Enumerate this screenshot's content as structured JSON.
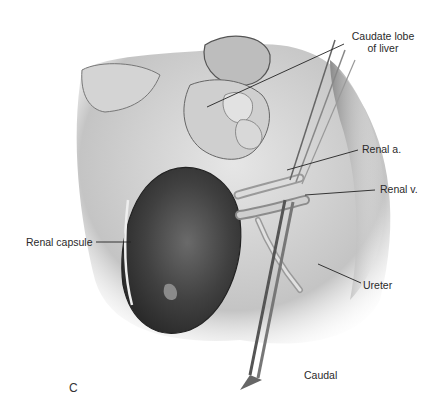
{
  "figure": {
    "panel_letter": "C",
    "orientation_label": "Caudal",
    "labels": {
      "caudate_lobe_line1": "Caudate lobe",
      "caudate_lobe_line2": "of liver",
      "renal_artery": "Renal a.",
      "renal_vein": "Renal v.",
      "renal_capsule": "Renal capsule",
      "ureter": "Ureter"
    },
    "colors": {
      "background": "#ffffff",
      "ink": "#2a2a2a",
      "tissue_light": "#d8d8d8",
      "tissue_mid": "#9a9a9a",
      "kidney_dark": "#3c3c3c"
    }
  }
}
